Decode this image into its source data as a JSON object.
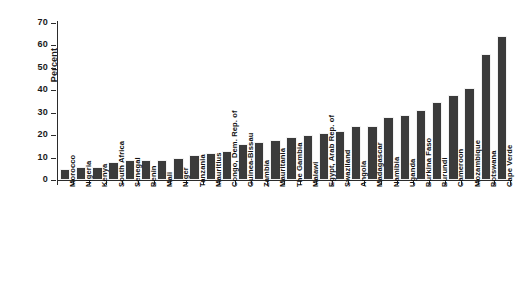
{
  "chart_data": {
    "type": "bar",
    "title": "",
    "subtitle": "",
    "xlabel": "",
    "ylabel": "Percent",
    "ylim": [
      0,
      70
    ],
    "yticks": [
      0,
      10,
      20,
      30,
      40,
      50,
      60,
      70
    ],
    "grid": false,
    "legend": null,
    "bar_color": "#3b3b3b",
    "axis_color": "#2b2b2b",
    "background": "#ffffff",
    "categories": [
      "Morocco",
      "Nigeria",
      "Kenya",
      "South Africa",
      "Senegal",
      "Benin",
      "Mali",
      "Niger",
      "Tanzania",
      "Mauritius",
      "Congo, Dem. Rep. of",
      "Guinea-Bissau",
      "Zambia",
      "Mauritania",
      "The Gambia",
      "Malawi",
      "Egypt, Arab Rep. of",
      "Swaziland",
      "Angola",
      "Madagascar",
      "Namibia",
      "Uganda",
      "Burkina Faso",
      "Burundi",
      "Cameroon",
      "Mozambique",
      "Botswana",
      "Cape Verde"
    ],
    "values": [
      5,
      6,
      6,
      8,
      9,
      9,
      9,
      10,
      11,
      12,
      13,
      16,
      17,
      18,
      19,
      20,
      21,
      22,
      24,
      24,
      28,
      29,
      31,
      35,
      38,
      41,
      56,
      64
    ]
  }
}
